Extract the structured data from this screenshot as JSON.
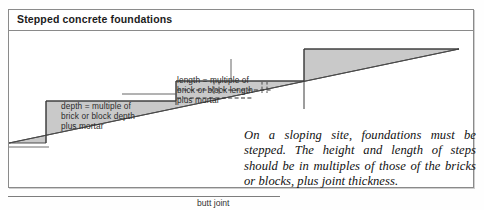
{
  "panel": {
    "title": "Stepped concrete foundations"
  },
  "annotations": {
    "depth_label": "depth = multiple of\nbrick or block depth\nplus mortar",
    "length_label": "length = multiple of\nbrick or block length\nplus mortar"
  },
  "caption": {
    "text": "On a sloping site, foundations must be stepped. The height and length of steps should be in multiples of those of the bricks or blocks, plus joint thickness."
  },
  "footer": {
    "butt_joint_label": "butt joint"
  },
  "colors": {
    "concrete_fill": "#c9c9c9",
    "outline": "#3a3a3a",
    "frame_border": "#8a8a8a",
    "ground_line": "#555555",
    "text": "#2b2b2b"
  },
  "diagram": {
    "steps": [
      {
        "name": "step-1",
        "top_y": 78,
        "left_x": 45,
        "right_x": 175
      },
      {
        "name": "step-2",
        "top_y": 58,
        "left_x": 175,
        "right_x": 303
      },
      {
        "name": "step-3",
        "top_y": 26,
        "left_x": 303,
        "right_x": 455
      }
    ],
    "ground_slope": {
      "x1": 8,
      "y1": 122,
      "x2": 458,
      "y2": 26
    },
    "mortar_courses": 2
  }
}
